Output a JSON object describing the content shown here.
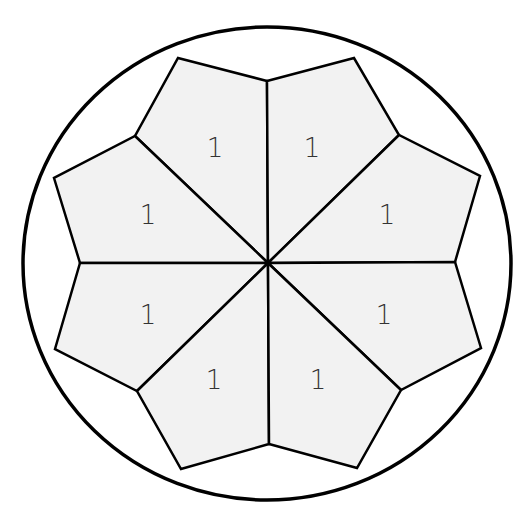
{
  "diagram": {
    "type": "eight-petal fraction wheel",
    "colors": {
      "stroke": "#000000",
      "fill": "#f2f2f2",
      "background": "#ffffff"
    },
    "petals": [
      {
        "id": "top-left",
        "label": "1"
      },
      {
        "id": "top-right",
        "label": "1"
      },
      {
        "id": "upper-left",
        "label": "1"
      },
      {
        "id": "upper-right",
        "label": "1"
      },
      {
        "id": "lower-left",
        "label": "1"
      },
      {
        "id": "lower-right",
        "label": "1"
      },
      {
        "id": "bottom-left",
        "label": "1"
      },
      {
        "id": "bottom-right",
        "label": "1"
      }
    ]
  }
}
